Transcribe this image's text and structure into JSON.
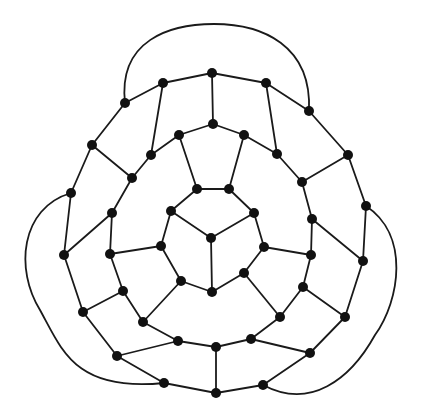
{
  "diagram": {
    "type": "planar-graph",
    "colors": {
      "edge": "#1a1a1a",
      "node": "#111111",
      "background": "#ffffff"
    },
    "node_radius": 5,
    "nodes": {
      "T1": [
        125,
        103
      ],
      "T2": [
        163,
        83
      ],
      "T3": [
        212,
        73
      ],
      "T4": [
        266,
        83
      ],
      "T5": [
        309,
        111
      ],
      "M1": [
        151,
        155
      ],
      "M2": [
        179,
        135
      ],
      "M3": [
        213,
        124
      ],
      "M4": [
        244,
        135
      ],
      "M5": [
        277,
        154
      ],
      "L1": [
        92,
        145
      ],
      "L2": [
        132,
        178
      ],
      "L3": [
        71,
        193
      ],
      "L4": [
        112,
        213
      ],
      "L5": [
        64,
        255
      ],
      "L6": [
        110,
        254
      ],
      "L7": [
        123,
        291
      ],
      "L8": [
        83,
        312
      ],
      "R1": [
        348,
        155
      ],
      "R2": [
        302,
        182
      ],
      "R3": [
        366,
        206
      ],
      "R4": [
        312,
        219
      ],
      "R5": [
        311,
        255
      ],
      "R6": [
        363,
        261
      ],
      "R7": [
        303,
        287
      ],
      "R8": [
        345,
        317
      ],
      "B1": [
        143,
        322
      ],
      "B2": [
        280,
        317
      ],
      "B3": [
        178,
        341
      ],
      "B4": [
        216,
        347
      ],
      "B5": [
        251,
        339
      ],
      "B6": [
        117,
        356
      ],
      "B7": [
        310,
        353
      ],
      "B8": [
        164,
        383
      ],
      "B9": [
        216,
        393
      ],
      "B10": [
        263,
        385
      ],
      "A1": [
        197,
        189
      ],
      "A2": [
        229,
        189
      ],
      "A3": [
        254,
        213
      ],
      "A4": [
        264,
        247
      ],
      "A5": [
        244,
        273
      ],
      "A6": [
        212,
        292
      ],
      "A7": [
        181,
        281
      ],
      "A8": [
        161,
        246
      ],
      "A9": [
        171,
        211
      ],
      "C0": [
        211,
        238
      ]
    },
    "edges": [
      [
        "T1",
        "T2"
      ],
      [
        "T2",
        "T3"
      ],
      [
        "T3",
        "T4"
      ],
      [
        "T4",
        "T5"
      ],
      [
        "T1",
        "L1"
      ],
      [
        "T5",
        "R1"
      ],
      [
        "T3",
        "M3"
      ],
      [
        "T2",
        "M1"
      ],
      [
        "T4",
        "M5"
      ],
      [
        "M3",
        "M2"
      ],
      [
        "M3",
        "M4"
      ],
      [
        "M2",
        "M1"
      ],
      [
        "M4",
        "M5"
      ],
      [
        "M2",
        "A1"
      ],
      [
        "M4",
        "A2"
      ],
      [
        "M1",
        "L2"
      ],
      [
        "M5",
        "R2"
      ],
      [
        "L1",
        "L2"
      ],
      [
        "L1",
        "L3"
      ],
      [
        "L2",
        "L4"
      ],
      [
        "L3",
        "L5"
      ],
      [
        "L5",
        "L4"
      ],
      [
        "L4",
        "L6"
      ],
      [
        "L6",
        "A8"
      ],
      [
        "L6",
        "L7"
      ],
      [
        "L5",
        "L8"
      ],
      [
        "L8",
        "L7"
      ],
      [
        "L8",
        "B6"
      ],
      [
        "L7",
        "B1"
      ],
      [
        "B1",
        "A7"
      ],
      [
        "B1",
        "B3"
      ],
      [
        "B3",
        "B6"
      ],
      [
        "B3",
        "B4"
      ],
      [
        "B4",
        "B5"
      ],
      [
        "B4",
        "B9"
      ],
      [
        "B5",
        "B7"
      ],
      [
        "B5",
        "B2"
      ],
      [
        "B2",
        "A5"
      ],
      [
        "B2",
        "R7"
      ],
      [
        "B6",
        "B8"
      ],
      [
        "B8",
        "B9"
      ],
      [
        "B9",
        "B10"
      ],
      [
        "B10",
        "B7"
      ],
      [
        "R1",
        "R3"
      ],
      [
        "R1",
        "R2"
      ],
      [
        "R2",
        "R4"
      ],
      [
        "R3",
        "R6"
      ],
      [
        "R4",
        "R6"
      ],
      [
        "R4",
        "R5"
      ],
      [
        "R5",
        "A4"
      ],
      [
        "R5",
        "R7"
      ],
      [
        "R6",
        "R8"
      ],
      [
        "R7",
        "R8"
      ],
      [
        "R8",
        "B7"
      ],
      [
        "A1",
        "A2"
      ],
      [
        "A2",
        "A3"
      ],
      [
        "A3",
        "A4"
      ],
      [
        "A4",
        "A5"
      ],
      [
        "A5",
        "A6"
      ],
      [
        "A6",
        "A7"
      ],
      [
        "A7",
        "A8"
      ],
      [
        "A8",
        "A9"
      ],
      [
        "A9",
        "A1"
      ],
      [
        "C0",
        "A9"
      ],
      [
        "C0",
        "A3"
      ],
      [
        "C0",
        "A6"
      ]
    ],
    "outer_arcs": [
      {
        "name": "top-arc",
        "path": "M125,103 C118,40 170,24 214,24 C262,24 312,45 309,111"
      },
      {
        "name": "left-arc",
        "path": "M71,193 C20,208 15,270 40,310 C62,350 75,392 164,383"
      },
      {
        "name": "right-arc",
        "path": "M366,206 C410,235 400,300 375,335 C350,380 310,410 263,385"
      }
    ]
  }
}
